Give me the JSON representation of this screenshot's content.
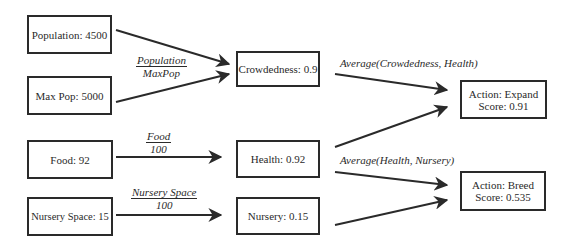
{
  "diagram": {
    "inputs": {
      "population": "Population: 4500",
      "max_pop": "Max Pop: 5000",
      "food": "Food: 92",
      "nursery_space": "Nursery Space: 15"
    },
    "intermediates": {
      "crowdedness": "Crowdedness: 0.9",
      "health": "Health: 0.92",
      "nursery": "Nursery: 0.15"
    },
    "actions": {
      "expand": {
        "action": "Action: Expand",
        "score": "Score: 0.91"
      },
      "breed": {
        "action": "Action: Breed",
        "score": "Score: 0.535"
      }
    },
    "edge_labels": {
      "crowdedness_formula": {
        "numerator": "Population",
        "denominator": "MaxPop"
      },
      "health_formula": {
        "numerator": "Food",
        "denominator": "100"
      },
      "nursery_formula": {
        "numerator": "Nursery Space",
        "denominator": "100"
      },
      "expand_formula": "Average(Crowdedness, Health)",
      "breed_formula": "Average(Health, Nursery)"
    },
    "colors": {
      "stroke": "#2a2a2a",
      "background": "#ffffff"
    }
  }
}
